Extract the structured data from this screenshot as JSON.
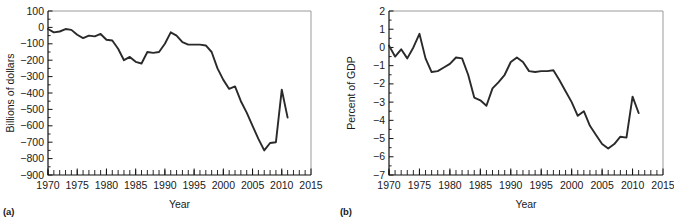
{
  "figure": {
    "panels": [
      {
        "tag": "(a)",
        "ylabel": "Billions of dollars",
        "xlabel": "Year"
      },
      {
        "tag": "(b)",
        "ylabel": "Percent of GDP",
        "xlabel": "Year"
      }
    ],
    "x_tick_labels": [
      "1970",
      "1975",
      "1980",
      "1985",
      "1990",
      "1995",
      "2000",
      "2005",
      "2010",
      "2015"
    ],
    "panel_a_y_tick_labels": [
      "100",
      "0",
      "−100",
      "−200",
      "−300",
      "−400",
      "−500",
      "−600",
      "−700",
      "−800",
      "−900"
    ],
    "panel_b_y_tick_labels": [
      "2",
      "1",
      "0",
      "−1",
      "−2",
      "−3",
      "−4",
      "−5",
      "−6",
      "−7"
    ],
    "line_color": "#2a2a2a",
    "frame_color": "#111111"
  },
  "chart_data": [
    {
      "type": "line",
      "title": "",
      "panel": "(a)",
      "xlabel": "Year",
      "ylabel": "Billions of dollars",
      "xlim": [
        1970,
        2015
      ],
      "ylim": [
        -900,
        100
      ],
      "xticks": [
        1970,
        1975,
        1980,
        1985,
        1990,
        1995,
        2000,
        2005,
        2010,
        2015
      ],
      "yticks": [
        100,
        0,
        -100,
        -200,
        -300,
        -400,
        -500,
        -600,
        -700,
        -800,
        -900
      ],
      "minor_xtick_interval": 1,
      "grid": false,
      "legend": null,
      "x": [
        1970,
        1971,
        1972,
        1973,
        1974,
        1975,
        1976,
        1977,
        1978,
        1979,
        1980,
        1981,
        1982,
        1983,
        1984,
        1985,
        1986,
        1987,
        1988,
        1989,
        1990,
        1991,
        1992,
        1993,
        1994,
        1995,
        1996,
        1997,
        1998,
        1999,
        2000,
        2001,
        2002,
        2003,
        2004,
        2005,
        2006,
        2007,
        2008,
        2009,
        2010,
        2011
      ],
      "values": [
        -3,
        -23,
        -23,
        -15,
        -6,
        -53,
        -74,
        -54,
        -59,
        -41,
        -74,
        -79,
        -128,
        -208,
        -185,
        -212,
        -221,
        -150,
        -155,
        -153,
        -221,
        -269,
        -290,
        -255,
        -203,
        -164,
        -107,
        -22,
        69,
        126,
        236,
        128,
        -158,
        -378,
        -413,
        -318,
        -248,
        -161,
        -459,
        -1413,
        -1294,
        -1300
      ],
      "values_plotted": [
        -10,
        -30,
        -25,
        -10,
        -15,
        -45,
        -65,
        -50,
        -55,
        -40,
        -75,
        -80,
        -130,
        -200,
        -180,
        -210,
        -220,
        -150,
        -155,
        -150,
        -100,
        -30,
        -50,
        -90,
        -105,
        -105,
        -105,
        -110,
        -150,
        -250,
        -320,
        -375,
        -360,
        -450,
        -520,
        -600,
        -680,
        -750,
        -705,
        -700,
        -380,
        -550
      ],
      "notes": "Line traced from plotted pixels; peak deficit about -750 near 2005-2006, sharp recovery to about -380 near 2009, ending about -550 in 2011."
    },
    {
      "type": "line",
      "title": "",
      "panel": "(b)",
      "xlabel": "Year",
      "ylabel": "Percent of GDP",
      "xlim": [
        1970,
        2015
      ],
      "ylim": [
        -7,
        2
      ],
      "xticks": [
        1970,
        1975,
        1980,
        1985,
        1990,
        1995,
        2000,
        2005,
        2010,
        2015
      ],
      "yticks": [
        2,
        1,
        0,
        -1,
        -2,
        -3,
        -4,
        -5,
        -6,
        -7
      ],
      "minor_xtick_interval": 1,
      "grid": false,
      "legend": null,
      "x": [
        1970,
        1971,
        1972,
        1973,
        1974,
        1975,
        1976,
        1977,
        1978,
        1979,
        1980,
        1981,
        1982,
        1983,
        1984,
        1985,
        1986,
        1987,
        1988,
        1989,
        1990,
        1991,
        1992,
        1993,
        1994,
        1995,
        1996,
        1997,
        1998,
        1999,
        2000,
        2001,
        2002,
        2003,
        2004,
        2005,
        2006,
        2007,
        2008,
        2009,
        2010,
        2011
      ],
      "values_plotted": [
        0.1,
        -0.5,
        -0.1,
        -0.6,
        0.0,
        0.75,
        -0.6,
        -1.35,
        -1.3,
        -1.1,
        -0.9,
        -0.55,
        -0.6,
        -1.5,
        -2.75,
        -2.9,
        -3.2,
        -2.25,
        -1.9,
        -1.5,
        -0.8,
        -0.55,
        -0.8,
        -1.3,
        -1.35,
        -1.3,
        -1.3,
        -1.25,
        -1.8,
        -2.4,
        -3.0,
        -3.75,
        -3.5,
        -4.3,
        -4.8,
        -5.3,
        -5.55,
        -5.3,
        -4.9,
        -4.95,
        -2.7,
        -3.6
      ],
      "notes": "Line traced from plotted pixels; zigzag 1970-1976 crossing zero, peak deficit about -5.55 near 2006, recovery to about -2.7 near 2010, ending about -3.6 in 2011."
    }
  ]
}
